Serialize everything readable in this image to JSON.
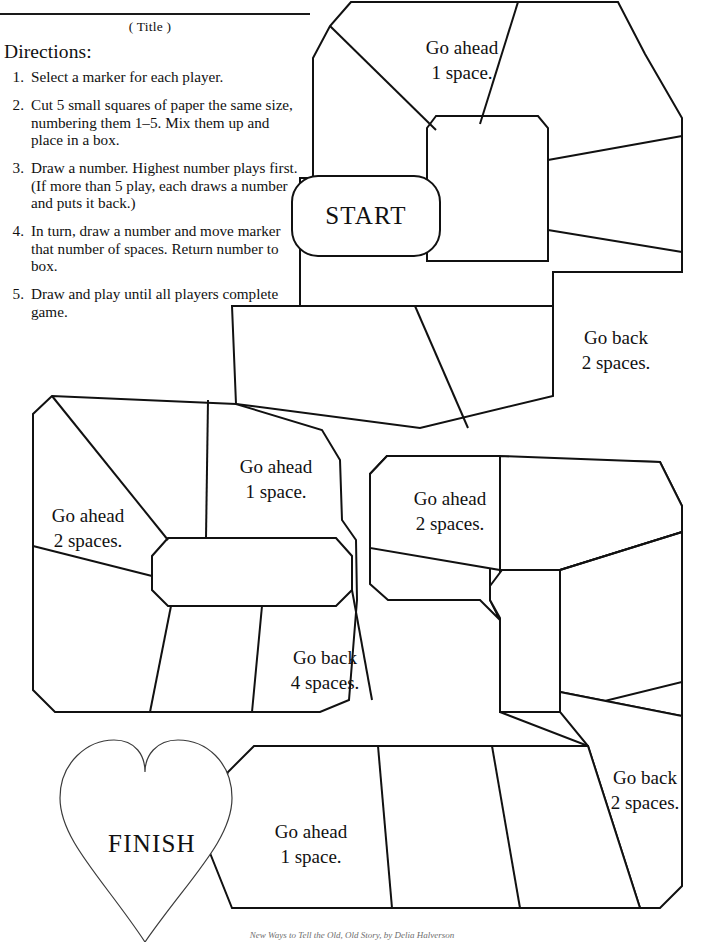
{
  "sheet": {
    "title_label": "( Title )",
    "directions_heading": "Directions:",
    "footer_credit": "New Ways to Tell the Old, Old Story, by Delia Halverson"
  },
  "directions": [
    {
      "num": "1.",
      "text": "Select a marker for each player."
    },
    {
      "num": "2.",
      "text": "Cut 5 small squares of paper the same size, numbering them 1–5.  Mix them up and place in a box."
    },
    {
      "num": "3.",
      "text": "Draw a number.  Highest number plays first.  (If more than 5 play, each draws a number and puts it back.)"
    },
    {
      "num": "4.",
      "text": "In turn, draw a number and move marker that number of spaces.  Return number to box."
    },
    {
      "num": "5.",
      "text": "Draw and play until all players complete game."
    }
  ],
  "board": {
    "start_label": "START",
    "finish_label": "FINISH",
    "spaces": [
      {
        "id": "top-go-ahead-1",
        "line1": "Go ahead",
        "line2": "1 space."
      },
      {
        "id": "right-go-back-2",
        "line1": "Go back",
        "line2": "2 spaces."
      },
      {
        "id": "mid-go-ahead-1",
        "line1": "Go ahead",
        "line2": "1 space."
      },
      {
        "id": "left-go-ahead-2",
        "line1": "Go ahead",
        "line2": "2 spaces."
      },
      {
        "id": "mid-go-ahead-2",
        "line1": "Go ahead",
        "line2": "2 spaces."
      },
      {
        "id": "mid-go-back-4",
        "line1": "Go back",
        "line2": "4 spaces."
      },
      {
        "id": "lower-right-go-back-2",
        "line1": "Go back",
        "line2": "2 spaces."
      },
      {
        "id": "bottom-go-ahead-1",
        "line1": "Go ahead",
        "line2": "1 space."
      }
    ]
  },
  "colors": {
    "ink": "#111111",
    "paper": "#ffffff",
    "heart_outline": "#3b3b3b",
    "credit": "#6e6e6e"
  }
}
